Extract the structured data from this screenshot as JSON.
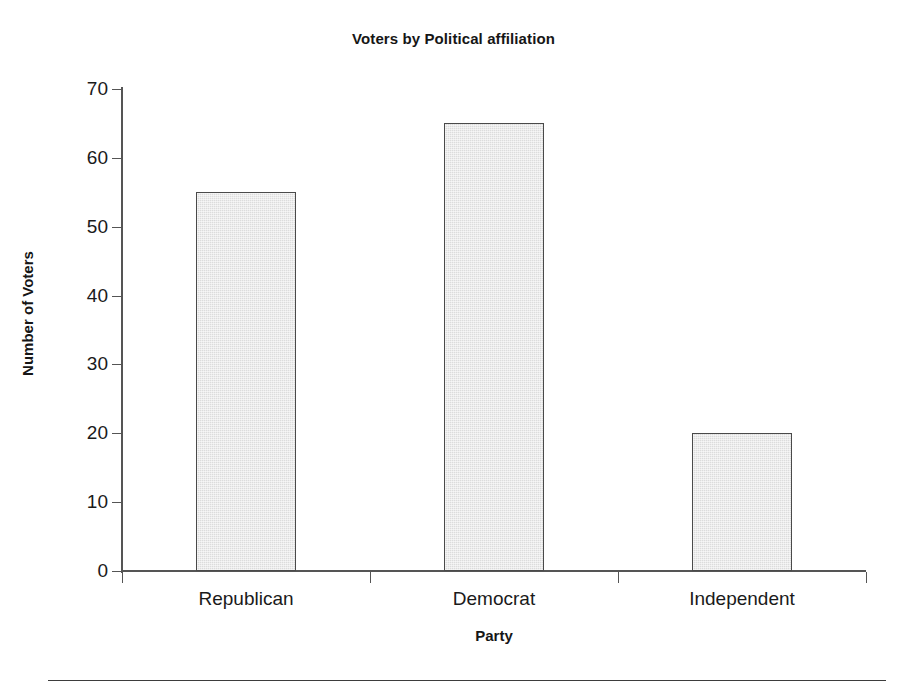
{
  "chart_data": {
    "type": "bar",
    "title": "Voters by Political affiliation",
    "xlabel": "Party",
    "ylabel": "Number of Voters",
    "categories": [
      "Republican",
      "Democrat",
      "Independent"
    ],
    "values": [
      55,
      65,
      20
    ],
    "ylim": [
      0,
      70
    ],
    "yticks": [
      0,
      10,
      20,
      30,
      40,
      50,
      60,
      70
    ],
    "ytick_labels": [
      "0",
      "10",
      "20",
      "30",
      "40",
      "50",
      "60",
      "70"
    ],
    "grid": false,
    "legend": false,
    "bar_fill_color": "#dcdcdc",
    "bar_edge_color": "#4a4a4a",
    "axis_color": "#555555",
    "text_color": "#1a1a1a"
  }
}
